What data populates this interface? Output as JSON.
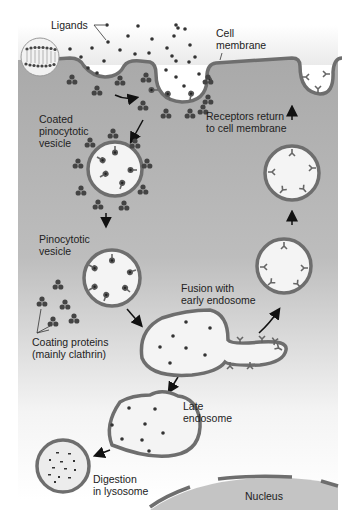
{
  "diagram": {
    "colors": {
      "cytoplasm": "#b8b8b8",
      "membrane": "#6e6e6e",
      "vesicle_fill": "#f4f4f4",
      "particles": "#333333",
      "nucleus": "#c4c4c4",
      "background": "#ffffff"
    },
    "labels": {
      "ligands": "Ligands",
      "cell_membrane": "Cell\nmembrane",
      "coated_vesicle": "Coated\npinocytotic\nvesicle",
      "receptors_return": "Receptors return\nto cell membrane",
      "pinocytotic_vesicle": "Pinocytotic\nvesicle",
      "fusion": "Fusion with\nearly endosome",
      "coating_proteins": "Coating proteins\n(mainly clathrin)",
      "late_endosome": "Late\nendosome",
      "digestion": "Digestion\nin lysosome",
      "nucleus": "Nucleus"
    },
    "stages": [
      "Ligands bind receptors at cell membrane",
      "Coated pinocytotic vesicle",
      "Pinocytotic vesicle",
      "Fusion with early endosome",
      "Late endosome",
      "Digestion in lysosome",
      "Receptors return to cell membrane"
    ]
  }
}
